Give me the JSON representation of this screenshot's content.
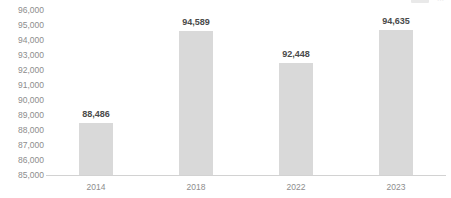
{
  "top_remnant": {
    "text": "",
    "dots": "⋯"
  },
  "chart_data": {
    "type": "bar",
    "title": "",
    "subtitle": "",
    "xlabel": "",
    "ylabel": "",
    "categories": [
      "2014",
      "2018",
      "2022",
      "2023"
    ],
    "values": [
      88486,
      94589,
      92448,
      94635
    ],
    "value_labels": [
      "88,486",
      "94,589",
      "92,448",
      "94,635"
    ],
    "series": [
      {
        "name": "",
        "values": [
          88486,
          94589,
          92448,
          94635
        ]
      }
    ],
    "ylim": [
      85000,
      96000
    ],
    "ytick_step": 1000,
    "ytick_labels": [
      "96,000",
      "95,000",
      "94,000",
      "93,000",
      "92,000",
      "91,000",
      "90,000",
      "89,000",
      "88,000",
      "87,000",
      "86,000",
      "85,000"
    ],
    "ytick_values": [
      96000,
      95000,
      94000,
      93000,
      92000,
      91000,
      90000,
      89000,
      88000,
      87000,
      86000,
      85000
    ],
    "grid": false,
    "legend": false,
    "legend_position": "none",
    "bar_color": "#d9d9d9",
    "axis_color": "#d2d2d2",
    "tick_label_color": "#8d8d8d",
    "value_label_color": "#4a4a4a",
    "background_color": "#ffffff",
    "annotations": []
  }
}
